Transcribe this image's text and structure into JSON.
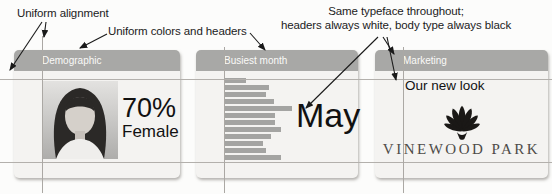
{
  "annotations": {
    "alignment": "Uniform alignment",
    "colors_headers": "Uniform colors and headers",
    "typeface_line1": "Same typeface throughout;",
    "typeface_line2": "headers always white, body type always black"
  },
  "cards": {
    "demographic": {
      "header": "Demographic",
      "stat_value": "70%",
      "stat_label": "Female"
    },
    "busiest_month": {
      "header": "Busiest month",
      "highlight_label": "May"
    },
    "marketing": {
      "header": "Marketing",
      "tagline": "Our new look",
      "brand_name": "VINEWOOD PARK"
    }
  },
  "chart_data": {
    "type": "bar",
    "orientation": "horizontal",
    "title": "Busiest month",
    "categories": [
      "Jan",
      "Feb",
      "Mar",
      "Apr",
      "May",
      "Jun",
      "Jul",
      "Aug",
      "Sep",
      "Oct",
      "Nov",
      "Dec"
    ],
    "values": [
      32,
      66,
      62,
      74,
      100,
      75,
      75,
      84,
      69,
      57,
      62,
      84
    ],
    "value_unit": "relative % of longest bar (no axis labels shown)",
    "highlight_category": "May",
    "grid": false,
    "legend": false
  },
  "icons": {
    "portrait_photo": "woman-portrait-photo",
    "shell_logo": "scallop-shell-logo"
  },
  "colors": {
    "header_bg": "#a8a8a6",
    "header_text": "#fafaf8",
    "card_bg": "#f4f3f1",
    "bar": "#a4a4a2",
    "guide_line": "#b3b0ac",
    "body_text": "#111111",
    "brand_text": "#4e4b48",
    "arrow": "#1a1a1a"
  }
}
